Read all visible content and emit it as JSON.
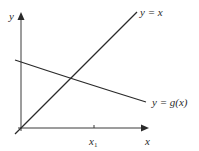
{
  "diagram": {
    "axes": {
      "x_label": "x",
      "y_label": "y"
    },
    "tick": {
      "label": "x",
      "subscript": "1"
    },
    "lines": [
      {
        "name": "identity",
        "label": "y = x"
      },
      {
        "name": "g",
        "label": "y = g(x)"
      }
    ],
    "colors": {
      "stroke": "#2a2a2a",
      "axis": "#3a3a3a",
      "background": "#ffffff"
    }
  }
}
